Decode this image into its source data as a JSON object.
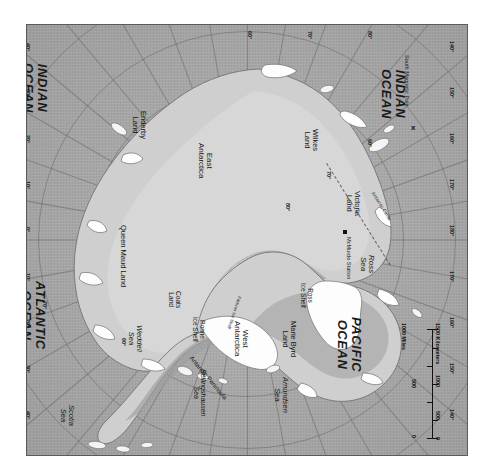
{
  "map": {
    "title": "Antarctica",
    "projection": "south polar azimuthal",
    "orientation_note": "map rotated 90 degrees clockwise within frame",
    "colors": {
      "ocean": "#a9a9a9",
      "land": "#cfcfcf",
      "ice_shelf": "#fdfdfd",
      "frame": "#5a5a5a",
      "graticule": "#5a5a5a",
      "text": "#1d1d1d"
    },
    "oceans": [
      {
        "name": "INDIAN\nOCEAN",
        "line1": "INDIAN",
        "line2": "OCEAN"
      },
      {
        "name": "ATLANTIC\nOCEAN",
        "line1": "ATLANTIC",
        "line2": "OCEAN"
      },
      {
        "name": "PACIFIC\nOCEAN",
        "line1": "PACIFIC",
        "line2": "OCEAN"
      }
    ],
    "ocean_labels": {
      "indian_top_l1": "INDIAN",
      "indian_top_l2": "OCEAN",
      "indian_right_l1": "INDIAN",
      "indian_right_l2": "OCEAN",
      "atlantic_l1": "ATLANTIC",
      "atlantic_l2": "OCEAN",
      "pacific_l1": "PACIFIC",
      "pacific_l2": "OCEAN"
    },
    "regions": {
      "east_antarctica_l1": "East",
      "east_antarctica_l2": "Antarctica",
      "west_antarctica_l1": "West",
      "west_antarctica_l2": "Antarctica",
      "enderby_l1": "Enderby",
      "enderby_l2": "Land",
      "wilkes_l1": "Wilkes",
      "wilkes_l2": "Land",
      "victoria_l1": "Victoria",
      "victoria_l2": "Land",
      "marie_byrd_l1": "Marie Byrd",
      "marie_byrd_l2": "Land",
      "queen_maud": "Queen Maud Land",
      "coats_l1": "Coats",
      "coats_l2": "Land",
      "antarctic_peninsula": "Antarctic Peninsula"
    },
    "seas": {
      "weddell_l1": "Weddell",
      "weddell_l2": "Sea",
      "ross_l1": "Ross",
      "ross_l2": "Sea",
      "scotia_l1": "Scotia",
      "scotia_l2": "Sea",
      "amundsen_l1": "Amundsen",
      "amundsen_l2": "Sea",
      "bellingshausen_l1": "Bellingshausen",
      "bellingshausen_l2": "Sea"
    },
    "ice_shelves": {
      "ronne_l1": "Ronne",
      "ronne_l2": "Ice Shelf",
      "ross_shelf_l1": "Ross",
      "ross_shelf_l2": "Ice Shelf",
      "filchner": "Filchner Ice Shelf"
    },
    "points": {
      "south_magnetic_pole": "South Magnetic Pole",
      "south_magnetic_pole_marker": "x",
      "mcmurdo_station": "McMurdo Station"
    },
    "lines": {
      "antarctic_circle": "Antarctic Circle"
    },
    "latitude_ticks": [
      "60°",
      "70°",
      "80°"
    ],
    "longitude_ticks_left": [
      "40°",
      "30°",
      "20°",
      "10°",
      "0°",
      "10°",
      "20°",
      "30°",
      "40°"
    ],
    "longitude_ticks_right": [
      "140°",
      "150°",
      "160°",
      "170°",
      "180°",
      "170°",
      "160°",
      "150°",
      "140°"
    ],
    "longitude_ticks_top": [
      "60°",
      "70°",
      "80°"
    ],
    "scale": {
      "miles": {
        "unit_label": "1000 Miles",
        "ticks": [
          "0",
          "500"
        ]
      },
      "kilometers": {
        "unit_label": "1500 Kilometers",
        "ticks": [
          "0",
          "500",
          "1000"
        ]
      }
    }
  }
}
